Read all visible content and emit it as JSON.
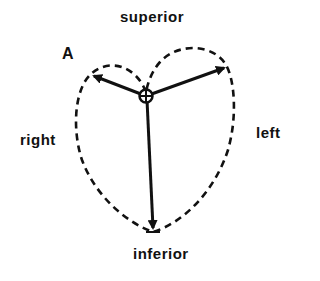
{
  "diagram": {
    "panel_label": "A",
    "labels": {
      "top": "superior",
      "bottom": "inferior",
      "left": "right",
      "right": "left"
    },
    "colors": {
      "stroke": "#111111",
      "background": "#ffffff"
    },
    "vectors": [
      {
        "name": "upper-left",
        "from": [
          146,
          96
        ],
        "to": [
          92,
          75
        ]
      },
      {
        "name": "upper-right",
        "from": [
          146,
          96
        ],
        "to": [
          226,
          67
        ]
      },
      {
        "name": "inferior",
        "from": [
          146,
          96
        ],
        "to": [
          153,
          230
        ]
      }
    ]
  }
}
